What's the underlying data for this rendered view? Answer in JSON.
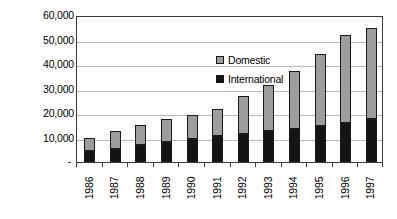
{
  "chart_data": {
    "type": "bar",
    "subtype": "stacked-column",
    "title": "",
    "xlabel": "",
    "ylabel": "Passengers x 1000",
    "categories": [
      "1986",
      "1987",
      "1988",
      "1989",
      "1990",
      "1991",
      "1992",
      "1993",
      "1994",
      "1995",
      "1996",
      "1997"
    ],
    "series": [
      {
        "name": "International",
        "color": "#141414",
        "values": [
          4500,
          5500,
          7000,
          8000,
          9500,
          10500,
          11500,
          12500,
          13500,
          14500,
          16000,
          17500
        ]
      },
      {
        "name": "Domestic",
        "color": "#9d9d9d",
        "values": [
          5500,
          7000,
          8000,
          9500,
          9500,
          11000,
          15500,
          19000,
          23500,
          29500,
          36000,
          37000
        ]
      }
    ],
    "totals": [
      10000,
      12500,
      15000,
      17500,
      19000,
      21500,
      27000,
      31500,
      37000,
      44000,
      52000,
      54500
    ],
    "ylim": [
      0,
      60000
    ],
    "ytick_values": [
      0,
      10000,
      20000,
      30000,
      40000,
      50000,
      60000
    ],
    "ytick_labels": [
      "-",
      "10,000",
      "20,000",
      "30,000",
      "40,000",
      "50,000",
      "60,000"
    ],
    "grid": true,
    "grid_axis": "y",
    "legend_position": "inside-top-left",
    "legend_entries": [
      "Domestic",
      "International"
    ]
  },
  "legend": {
    "items": [
      {
        "label": "Domestic",
        "swatch": "legend-swatch-domestic"
      },
      {
        "label": "International",
        "swatch": "legend-swatch-international"
      }
    ]
  },
  "axes": {
    "y_title": "Passengers x 1000"
  }
}
